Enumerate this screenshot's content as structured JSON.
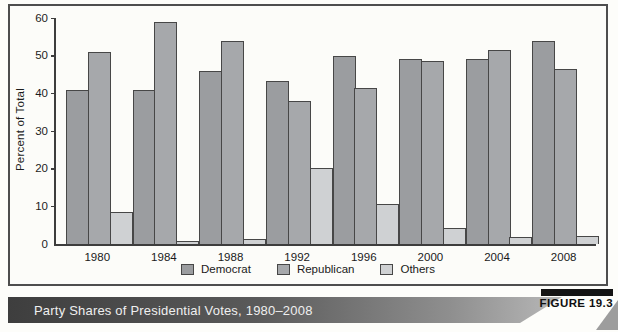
{
  "figure": {
    "caption": "Party Shares of Presidential Votes, 1980–2008",
    "tag": "FIGURE 19.3"
  },
  "colors": {
    "democrat_bar": "#9b9da0",
    "republican_bar": "#a6a8ab",
    "others_bar": "#cfd1d3",
    "axis": "#3d3d3d",
    "caption_gradient_start": "#3e3e3e",
    "caption_gradient_end": "#b8b8b8"
  },
  "chart_data": {
    "type": "bar",
    "title": "",
    "xlabel": "",
    "ylabel": "Percent of Total",
    "ylim": [
      0,
      60
    ],
    "yticks": [
      0,
      10,
      20,
      30,
      40,
      50,
      60
    ],
    "grid": false,
    "legend_position": "bottom",
    "categories": [
      "1980",
      "1984",
      "1988",
      "1992",
      "1996",
      "2000",
      "2004",
      "2008"
    ],
    "series": [
      {
        "name": "Democrat",
        "color": "#9b9da0",
        "values": [
          41.0,
          40.8,
          46.0,
          43.3,
          50.0,
          49.0,
          49.2,
          54.0
        ]
      },
      {
        "name": "Republican",
        "color": "#a6a8ab",
        "values": [
          51.0,
          59.0,
          53.8,
          38.0,
          41.3,
          48.7,
          51.5,
          46.4
        ]
      },
      {
        "name": "Others",
        "color": "#cfd1d3",
        "values": [
          8.5,
          0.8,
          1.3,
          20.2,
          10.7,
          4.2,
          1.8,
          2.2
        ]
      }
    ]
  }
}
